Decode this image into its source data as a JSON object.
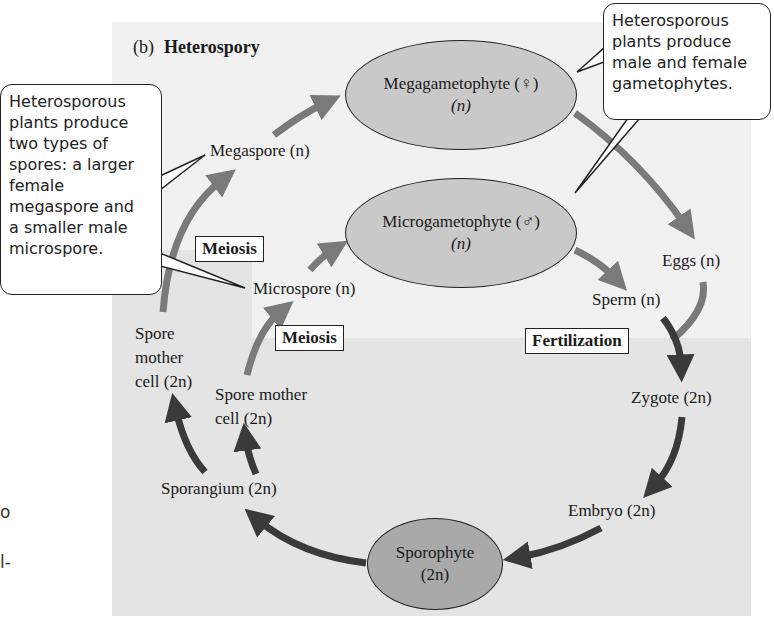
{
  "figure": {
    "panel_label": "(b)",
    "title": "Heterospory"
  },
  "nodes": {
    "megagametophyte": {
      "name": "Megagametophyte (♀)",
      "ploidy": "(n)"
    },
    "microgametophyte": {
      "name": "Microgametophyte (♂)",
      "ploidy": "(n)"
    },
    "sporophyte": {
      "name": "Sporophyte",
      "ploidy": "(2n)"
    },
    "megaspore": "Megaspore (n)",
    "microspore": "Microspore (n)",
    "eggs": "Eggs (n)",
    "sperm": "Sperm (n)",
    "zygote": "Zygote (2n)",
    "embryo": "Embryo (2n)",
    "sporangium": "Sporangium (2n)",
    "spore_mother_cell_outer": [
      "Spore",
      "mother",
      "cell (2n)"
    ],
    "spore_mother_cell_inner": [
      "Spore mother",
      "cell (2n)"
    ]
  },
  "process_labels": {
    "meiosis_upper": "Meiosis",
    "meiosis_lower": "Meiosis",
    "fertilization": "Fertilization"
  },
  "callouts": {
    "spores": [
      "Heterosporous",
      "plants produce",
      "two types of",
      "spores: a larger",
      "female",
      "megaspore and",
      "a smaller male",
      "microspore."
    ],
    "gametophytes": [
      "Heterosporous",
      "plants produce",
      "male and female",
      "gametophytes."
    ]
  },
  "margin_fragments": [
    "o",
    "l-"
  ],
  "colors": {
    "haploid_arrow": "#7a7a7a",
    "diploid_arrow": "#3a3a3a",
    "ellipse_light": "#c9c9c9",
    "ellipse_dark": "#a9a9a9",
    "panel_bg": "#f1f1f1",
    "diploid_bg": "#e4e4e4"
  }
}
